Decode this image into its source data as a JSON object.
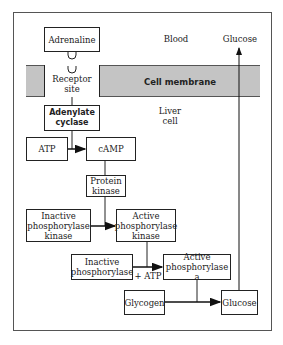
{
  "diagram": {
    "regions": {
      "blood": "Blood",
      "cell_membrane": "Cell membrane",
      "liver_cell_line1": "Liver",
      "liver_cell_line2": "cell"
    },
    "nodes": {
      "adrenaline": "Adrenaline",
      "receptor_line1": "Receptor",
      "receptor_line2": "site",
      "adenylate_line1": "Adenylate",
      "adenylate_line2": "cyclase",
      "atp": "ATP",
      "camp": "cAMP",
      "protein_kinase_line1": "Protein",
      "protein_kinase_line2": "kinase",
      "inactive_pk_line1": "Inactive",
      "inactive_pk_line2": "phosphorylase",
      "inactive_pk_line3": "kinase",
      "active_pk_line1": "Active",
      "active_pk_line2": "phosphorylase",
      "active_pk_line3": "kinase",
      "inactive_p_line1": "Inactive",
      "inactive_p_line2": "phosphorylase",
      "active_p_line1": "Active",
      "active_p_line2": "phosphorylase a",
      "glycogen": "Glycogen",
      "glucose_inner": "Glucose",
      "glucose_blood": "Glucose",
      "plus_atp": "+ ATP"
    },
    "edges": [
      {
        "from": "Adrenaline",
        "to": "Receptor site",
        "type": "binding"
      },
      {
        "from": "Receptor site",
        "to": "Adenylate cyclase",
        "type": "line"
      },
      {
        "from": "ATP",
        "to": "cAMP",
        "type": "arrow",
        "catalyst": "Adenylate cyclase"
      },
      {
        "from": "cAMP",
        "to": "Protein kinase",
        "type": "line"
      },
      {
        "from": "Inactive phosphorylase kinase",
        "to": "Active phosphorylase kinase",
        "type": "arrow",
        "catalyst": "Protein kinase"
      },
      {
        "from": "Inactive phosphorylase",
        "to": "Active phosphorylase a",
        "type": "arrow",
        "catalyst": "Active phosphorylase kinase",
        "cofactor": "+ ATP"
      },
      {
        "from": "Glycogen",
        "to": "Glucose",
        "type": "arrow",
        "catalyst": "Active phosphorylase a"
      },
      {
        "from": "Glucose",
        "to": "Glucose (blood)",
        "type": "arrow"
      }
    ],
    "colors": {
      "membrane": "#c4c4c4",
      "line": "#222222"
    }
  }
}
